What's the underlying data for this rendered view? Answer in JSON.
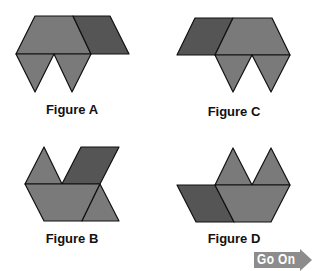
{
  "figures": [
    {
      "id": "A",
      "label": "Figure A"
    },
    {
      "id": "B",
      "label": "Figure B"
    },
    {
      "id": "C",
      "label": "Figure C"
    },
    {
      "id": "D",
      "label": "Figure D"
    }
  ],
  "colors": {
    "light_shape": "#7a7a7a",
    "dark_shape": "#555555",
    "outline": "#111111",
    "go_on": "#8c8c8c"
  },
  "navigation": {
    "go_on_label": "Go On"
  }
}
